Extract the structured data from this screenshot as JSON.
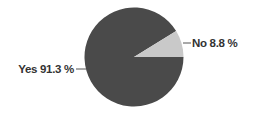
{
  "chart_data": {
    "type": "pie",
    "title": "",
    "categories": [
      "Yes",
      "No"
    ],
    "values": [
      91.3,
      8.8
    ],
    "labels": [
      "Yes 91.3 %",
      "No 8.8 %"
    ],
    "colors": [
      "#4a4a4a",
      "#c9c9c9"
    ],
    "start_angle_deg": 0,
    "direction": "counterclockwise-from-3-oclock for 'No' slice",
    "legend": "none (direct labels with leader lines)",
    "label_positions": {
      "Yes": "left",
      "No": "right"
    }
  },
  "labels": {
    "yes": "Yes 91.3 %",
    "no": "No 8.8 %"
  }
}
